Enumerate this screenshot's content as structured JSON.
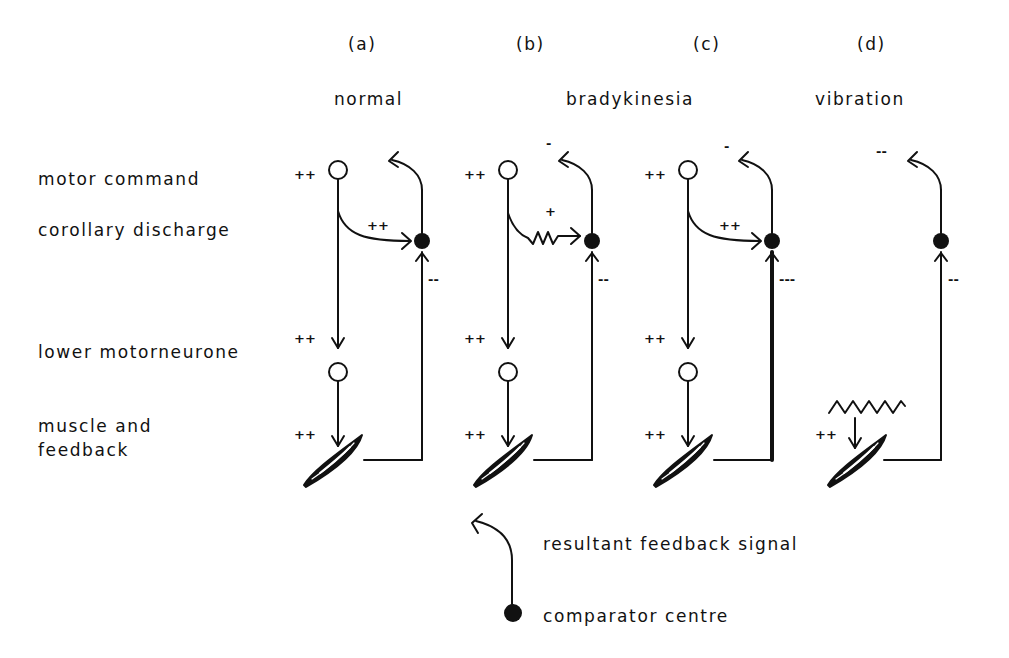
{
  "panels": [
    {
      "id": "a",
      "letter": "(a)",
      "title": "normal",
      "signs": {
        "motor_command": "++",
        "corollary": "++",
        "feedback_in": "--",
        "lower_motorneurone": "++",
        "muscle": "++",
        "resultant": ""
      },
      "corollary_path": "smooth"
    },
    {
      "id": "b",
      "letter": "(b)",
      "title": "bradykinesia",
      "signs": {
        "motor_command": "++",
        "corollary": "+",
        "feedback_in": "--",
        "lower_motorneurone": "++",
        "muscle": "++",
        "resultant": "-"
      },
      "corollary_path": "zigzag"
    },
    {
      "id": "c",
      "letter": "(c)",
      "title": "",
      "signs": {
        "motor_command": "++",
        "corollary": "++",
        "feedback_in": "---",
        "lower_motorneurone": "++",
        "muscle": "++",
        "resultant": "-"
      },
      "corollary_path": "smooth",
      "feedback_line": "thick"
    },
    {
      "id": "d",
      "letter": "(d)",
      "title": "vibration",
      "signs": {
        "motor_command": "",
        "corollary": "",
        "feedback_in": "--",
        "lower_motorneurone": "",
        "muscle": "++",
        "resultant": "--"
      },
      "corollary_path": "none",
      "stimulus": "vibration-zigzag"
    }
  ],
  "row_labels": {
    "motor_command": "motor command",
    "corollary_discharge": "corollary discharge",
    "lower_motorneurone": "lower motorneurone",
    "muscle_line1": "muscle and",
    "muscle_line2": "feedback"
  },
  "legend": {
    "resultant": "resultant feedback signal",
    "comparator": "comparator centre"
  },
  "colors": {
    "ink": "#111111",
    "background": "#ffffff"
  }
}
